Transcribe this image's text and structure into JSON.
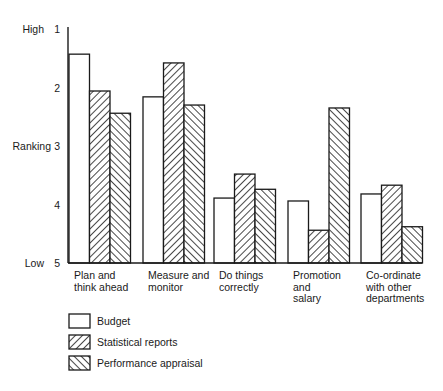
{
  "chart_data": {
    "type": "bar",
    "title": "",
    "xlabel": "",
    "ylabel": "Ranking",
    "y_axis": {
      "ticks": [
        1,
        2,
        3,
        4,
        5
      ],
      "tick_labels": [
        "1",
        "2",
        "3",
        "4",
        "5"
      ],
      "end_labels": {
        "top": "High",
        "bottom": "Low"
      },
      "inverted": true,
      "ylim": [
        1,
        5
      ]
    },
    "grid": false,
    "legend_position": "bottom-left",
    "categories": [
      [
        "Plan and",
        "think ahead"
      ],
      [
        "Measure and",
        "monitor"
      ],
      [
        "Do things",
        "correctly"
      ],
      [
        "Promotion",
        "and",
        "salary"
      ],
      [
        "Co-ordinate",
        "with other",
        "departments"
      ]
    ],
    "series": [
      {
        "name": "Budget",
        "pattern": "empty",
        "values": [
          1.43,
          2.16,
          3.89,
          3.94,
          3.82
        ]
      },
      {
        "name": "Statistical reports",
        "pattern": "forward-hatch",
        "values": [
          2.06,
          1.58,
          3.48,
          4.44,
          3.67
        ]
      },
      {
        "name": "Performance appraisal",
        "pattern": "back-hatch",
        "values": [
          2.44,
          2.3,
          3.74,
          2.35,
          4.38
        ]
      }
    ]
  }
}
